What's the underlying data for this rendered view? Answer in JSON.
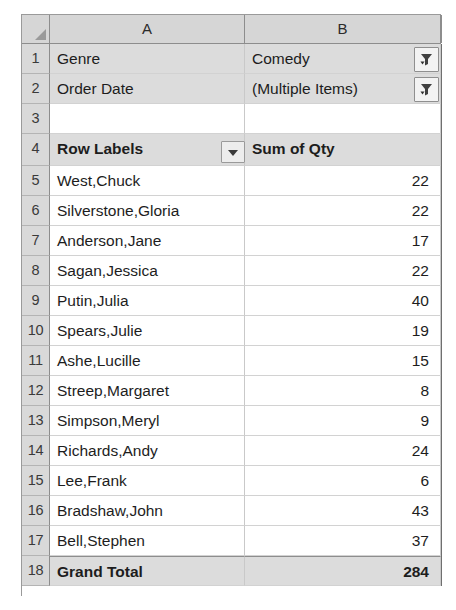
{
  "spreadsheet": {
    "columns": [
      "A",
      "B"
    ],
    "corner_icon": "select-all-triangle-icon",
    "filter_rows": [
      {
        "row": "1",
        "field": "Genre",
        "value": "Comedy",
        "button_icon": "filter-funnel-icon"
      },
      {
        "row": "2",
        "field": "Order Date",
        "value": "(Multiple Items)",
        "button_icon": "filter-funnel-icon"
      }
    ],
    "blank_row": {
      "row": "3",
      "a": "",
      "b": ""
    },
    "pivot_header": {
      "row": "4",
      "row_labels": "Row Labels",
      "value_header": "Sum of Qty",
      "dropdown_icon": "chevron-down-icon"
    },
    "rows": [
      {
        "row": "5",
        "label": "West,Chuck",
        "qty": "22"
      },
      {
        "row": "6",
        "label": "Silverstone,Gloria",
        "qty": "22"
      },
      {
        "row": "7",
        "label": "Anderson,Jane",
        "qty": "17"
      },
      {
        "row": "8",
        "label": "Sagan,Jessica",
        "qty": "22"
      },
      {
        "row": "9",
        "label": "Putin,Julia",
        "qty": "40"
      },
      {
        "row": "10",
        "label": "Spears,Julie",
        "qty": "19"
      },
      {
        "row": "11",
        "label": "Ashe,Lucille",
        "qty": "15"
      },
      {
        "row": "12",
        "label": "Streep,Margaret",
        "qty": "8"
      },
      {
        "row": "13",
        "label": "Simpson,Meryl",
        "qty": "9"
      },
      {
        "row": "14",
        "label": "Richards,Andy",
        "qty": "24"
      },
      {
        "row": "15",
        "label": "Lee,Frank",
        "qty": "6"
      },
      {
        "row": "16",
        "label": "Bradshaw,John",
        "qty": "43"
      },
      {
        "row": "17",
        "label": "Bell,Stephen",
        "qty": "37"
      }
    ],
    "grand_total": {
      "row": "18",
      "label": "Grand Total",
      "qty": "284"
    },
    "colors": {
      "header_fill": "#d6d6d6",
      "rowhead_fill": "#d9d9d9",
      "cell_fill": "#dcdcdc",
      "grid_line": "#c9c9c9",
      "text": "#1d1d1d"
    }
  }
}
